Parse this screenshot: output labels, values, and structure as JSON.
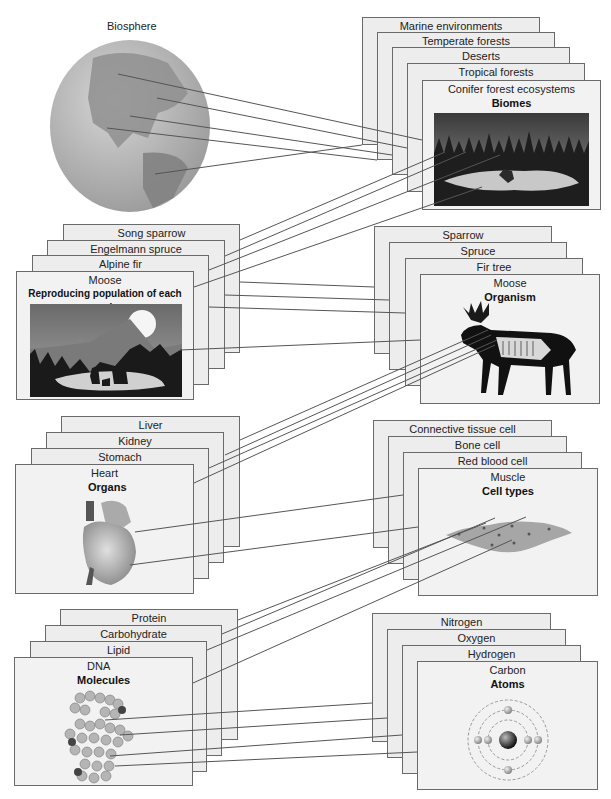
{
  "biosphere": {
    "label": "Biosphere"
  },
  "biomes": {
    "cards": [
      "Marine environments",
      "Temperate forests",
      "Deserts",
      "Tropical forests"
    ],
    "front": {
      "label": "Conifer forest ecosystems",
      "title": "Biomes"
    }
  },
  "populations": {
    "cards": [
      "Song sparrow",
      "Engelmann spruce",
      "Alpine fir"
    ],
    "front": {
      "label": "Moose",
      "title": "Reproducing population of each species"
    }
  },
  "organisms": {
    "cards": [
      "Sparrow",
      "Spruce",
      "Fir tree"
    ],
    "front": {
      "label": "Moose",
      "title": "Organism"
    }
  },
  "organs": {
    "cards": [
      "Liver",
      "Kidney",
      "Stomach"
    ],
    "front": {
      "label": "Heart",
      "title": "Organs"
    }
  },
  "cell_types": {
    "cards": [
      "Connective tissue cell",
      "Bone cell",
      "Red blood cell"
    ],
    "front": {
      "label": "Muscle",
      "title": "Cell types"
    }
  },
  "molecules": {
    "cards": [
      "Protein",
      "Carbohydrate",
      "Lipid"
    ],
    "front": {
      "label": "DNA",
      "title": "Molecules"
    }
  },
  "atoms": {
    "cards": [
      "Nitrogen",
      "Oxygen",
      "Hydrogen"
    ],
    "front": {
      "label": "Carbon",
      "title": "Atoms"
    }
  },
  "colors": {
    "card_fill": "#ededed",
    "card_border": "#6a6a6a",
    "line": "#555555",
    "globe": "#b8b8b8",
    "land": "#8f8f8f"
  }
}
